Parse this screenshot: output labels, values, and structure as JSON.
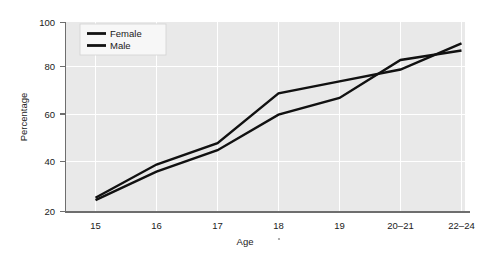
{
  "chart_data": {
    "type": "line",
    "title": "",
    "xlabel": "Age",
    "ylabel": "Percentage",
    "categories": [
      "15",
      "16",
      "17",
      "18",
      "19",
      "20–21",
      "22–24"
    ],
    "x_tick_labels": [
      "15",
      "16",
      "17",
      "18",
      "19",
      "20–21",
      "22–24"
    ],
    "y_tick_labels": [
      "20",
      "40",
      "60",
      "80",
      "100"
    ],
    "y_ticks": [
      20,
      40,
      60,
      80,
      100
    ],
    "ylim": [
      20,
      100
    ],
    "grid": "horizontal-and-vertical",
    "legend_position": "top-left-inside",
    "series": [
      {
        "name": "Female",
        "color": "#111111",
        "values": [
          26,
          40,
          49,
          70,
          75,
          80,
          91
        ]
      },
      {
        "name": "Male",
        "color": "#111111",
        "values": [
          25,
          37,
          46,
          61,
          68,
          84,
          88
        ]
      }
    ]
  },
  "legend": {
    "items": [
      {
        "label": "Female"
      },
      {
        "label": "Male"
      }
    ]
  },
  "axes": {
    "y_title": "Percentage",
    "x_title": "Age"
  },
  "colors": {
    "plot_background": "#e9e9e9",
    "page_background": "#ffffff",
    "grid": "#ffffff",
    "axis": "#6e6e6e",
    "series": "#111111",
    "text": "#1a1a1a"
  }
}
